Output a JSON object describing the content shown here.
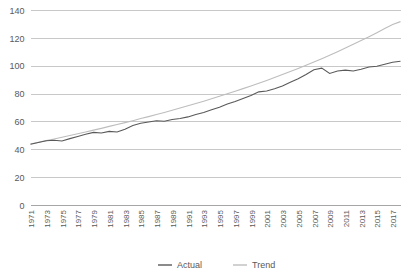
{
  "chart_data": {
    "type": "line",
    "title": "",
    "subtitle": "",
    "xlabel": "",
    "ylabel": "",
    "ylim": [
      0,
      140
    ],
    "ytick_labels": [
      "0",
      "20",
      "40",
      "60",
      "80",
      "100",
      "120",
      "140"
    ],
    "ytick_values": [
      0,
      20,
      40,
      60,
      80,
      100,
      120,
      140
    ],
    "grid": true,
    "legend_position": "bottom",
    "xlim": [
      1971,
      2018
    ],
    "xtick_labels": [
      "1971",
      "1973",
      "1975",
      "1977",
      "1979",
      "1981",
      "1983",
      "1985",
      "1987",
      "1989",
      "1991",
      "1993",
      "1995",
      "1997",
      "1999",
      "2001",
      "2003",
      "2005",
      "2007",
      "2009",
      "2011",
      "2013",
      "2015",
      "2017"
    ],
    "xtick_values": [
      1971,
      1973,
      1975,
      1977,
      1979,
      1981,
      1983,
      1985,
      1987,
      1989,
      1991,
      1993,
      1995,
      1997,
      1999,
      2001,
      2003,
      2005,
      2007,
      2009,
      2011,
      2013,
      2015,
      2017
    ],
    "x": [
      1971,
      1972,
      1973,
      1974,
      1975,
      1976,
      1977,
      1978,
      1979,
      1980,
      1981,
      1982,
      1983,
      1984,
      1985,
      1986,
      1987,
      1988,
      1989,
      1990,
      1991,
      1992,
      1993,
      1994,
      1995,
      1996,
      1997,
      1998,
      1999,
      2000,
      2001,
      2002,
      2003,
      2004,
      2005,
      2006,
      2007,
      2008,
      2009,
      2010,
      2011,
      2012,
      2013,
      2014,
      2015,
      2016,
      2017,
      2018
    ],
    "series": [
      {
        "name": "Actual",
        "color": "#595959",
        "values": [
          44.0,
          45.2,
          46.5,
          46.9,
          46.3,
          48.0,
          49.6,
          51.2,
          52.5,
          52.1,
          53.2,
          52.8,
          54.8,
          57.5,
          59.0,
          60.0,
          60.8,
          60.5,
          61.8,
          62.5,
          63.6,
          65.4,
          66.8,
          68.8,
          70.6,
          72.8,
          74.6,
          76.8,
          79.0,
          81.6,
          82.2,
          83.8,
          85.8,
          88.4,
          91.0,
          94.0,
          97.5,
          98.6,
          94.8,
          96.6,
          97.2,
          96.6,
          97.8,
          99.4,
          100.0,
          101.4,
          102.8,
          103.6
        ]
      },
      {
        "name": "Trend",
        "color": "#bdbdbd",
        "values": [
          44.2,
          45.4,
          46.6,
          47.8,
          49.0,
          50.3,
          51.5,
          52.8,
          54.1,
          55.4,
          56.8,
          58.1,
          59.5,
          60.9,
          62.4,
          63.8,
          65.3,
          66.8,
          68.4,
          70.0,
          71.6,
          73.2,
          74.9,
          76.6,
          78.4,
          80.2,
          82.0,
          83.9,
          85.8,
          87.8,
          89.8,
          91.9,
          94.0,
          96.2,
          98.4,
          100.7,
          103.0,
          105.4,
          107.9,
          110.4,
          113.0,
          115.7,
          118.4,
          121.2,
          124.1,
          127.0,
          130.0,
          132.0
        ]
      }
    ],
    "legend": [
      {
        "label": "Actual",
        "color": "#595959"
      },
      {
        "label": "Trend",
        "color": "#bdbdbd"
      }
    ]
  }
}
